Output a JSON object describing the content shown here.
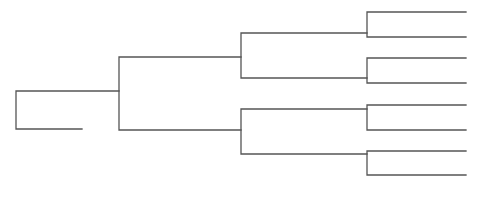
{
  "diagram": {
    "type": "bracket-tree",
    "width": 482,
    "height": 203,
    "line_color": "#555555",
    "background": "#ffffff",
    "connectors": [
      {
        "name": "root-bracket",
        "x": 16,
        "top_y": 91,
        "bottom_y": 129,
        "top_end_x": 119,
        "bottom_end_x": 82
      },
      {
        "name": "level2-bracket",
        "x": 119,
        "top_y": 57,
        "bottom_y": 130,
        "top_end_x": 241,
        "bottom_end_x": 241
      },
      {
        "name": "level3-upper-bracket",
        "x": 241,
        "top_y": 33,
        "bottom_y": 78,
        "top_end_x": 367,
        "bottom_end_x": 367
      },
      {
        "name": "level3-lower-bracket",
        "x": 241,
        "top_y": 109,
        "bottom_y": 154,
        "top_end_x": 367,
        "bottom_end_x": 367
      },
      {
        "name": "leaf-bracket-1",
        "x": 367,
        "top_y": 12,
        "bottom_y": 37,
        "top_end_x": 466,
        "bottom_end_x": 466
      },
      {
        "name": "leaf-bracket-2",
        "x": 367,
        "top_y": 58,
        "bottom_y": 83,
        "top_end_x": 466,
        "bottom_end_x": 466
      },
      {
        "name": "leaf-bracket-3",
        "x": 367,
        "top_y": 105,
        "bottom_y": 130,
        "top_end_x": 466,
        "bottom_end_x": 466
      },
      {
        "name": "leaf-bracket-4",
        "x": 367,
        "top_y": 151,
        "bottom_y": 175,
        "top_end_x": 466,
        "bottom_end_x": 466
      }
    ]
  }
}
